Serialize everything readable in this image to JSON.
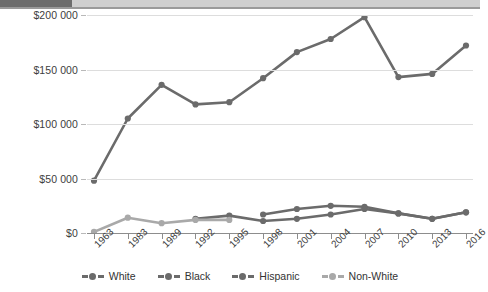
{
  "topbar": {
    "tab_label": ""
  },
  "chart_data": {
    "type": "line",
    "title": "",
    "subtitle": "",
    "xlabel": "",
    "ylabel": "",
    "grid": true,
    "legend_position": "bottom",
    "ylim": [
      0,
      200000
    ],
    "yticks": [
      0,
      50000,
      100000,
      150000,
      200000
    ],
    "ytick_labels": [
      "$0",
      "$50 000",
      "$100 000",
      "$150 000",
      "$200 000"
    ],
    "categories": [
      "1963",
      "1983",
      "1989",
      "1992",
      "1995",
      "1998",
      "2001",
      "2004",
      "2007",
      "2010",
      "2013",
      "2016"
    ],
    "series": [
      {
        "name": "White",
        "color": "#6b6b6b",
        "values": [
          null,
          null,
          null,
          null,
          null,
          17000,
          22000,
          25000,
          24000,
          18000,
          13000,
          19000
        ]
      },
      {
        "name": "Black",
        "color": "#6b6b6b",
        "values": [
          48000,
          105000,
          136000,
          118000,
          120000,
          142000,
          166000,
          178000,
          198000,
          143000,
          146000,
          172000
        ]
      },
      {
        "name": "Hispanic",
        "color": "#6b6b6b",
        "values": [
          null,
          null,
          null,
          13000,
          16000,
          11000,
          13000,
          17000,
          22000,
          18000,
          13000,
          19000
        ]
      },
      {
        "name": "Non-White",
        "color": "#a9a9a9",
        "values": [
          1000,
          14000,
          9000,
          12000,
          12000,
          null,
          null,
          null,
          null,
          null,
          null,
          null
        ]
      }
    ]
  }
}
